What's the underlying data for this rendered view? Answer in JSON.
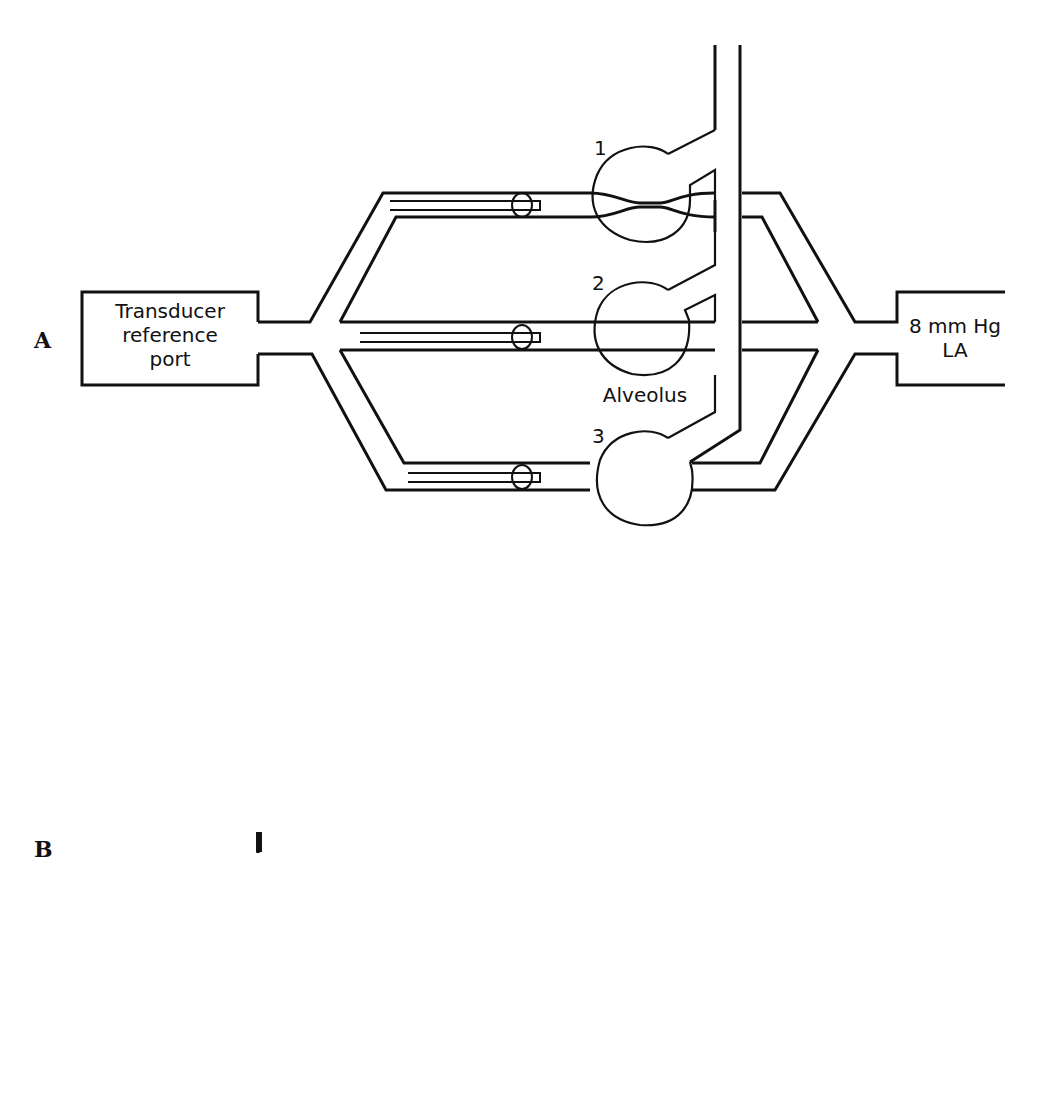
{
  "panels": [
    {
      "id": "A",
      "letter": "A",
      "transducer": [
        "Transducer",
        "reference",
        "port"
      ],
      "la": {
        "pressure": "8 mm Hg",
        "label": "LA"
      },
      "alveoli": [
        {
          "number": "1",
          "state": "collapsed-narrow",
          "pressure": ""
        },
        {
          "number": "2",
          "state": "open",
          "pressure": ""
        },
        {
          "number": "3",
          "state": "open",
          "pressure": ""
        }
      ],
      "alveolus_label": "Alveolus"
    },
    {
      "id": "B",
      "letter": "B",
      "transducer": [
        "Transducer",
        "reference",
        "port"
      ],
      "la": {
        "pressure": "5 mm Hg",
        "label": "LA"
      },
      "alveoli": [
        {
          "number": "1",
          "state": "collapsed",
          "pressure": "11 mm Hg"
        },
        {
          "number": "2",
          "state": "crossed",
          "pressure": "11 mm Hg"
        },
        {
          "number": "3",
          "state": "open",
          "pressure": "11 mm Hg"
        }
      ],
      "alveolus_label": "Alveolus",
      "scale_bars": [
        {
          "top": "7 cm",
          "bottom": "5 mm Hg"
        },
        {
          "top": "7 cm",
          "bottom": "5 mm Hg"
        }
      ]
    }
  ]
}
